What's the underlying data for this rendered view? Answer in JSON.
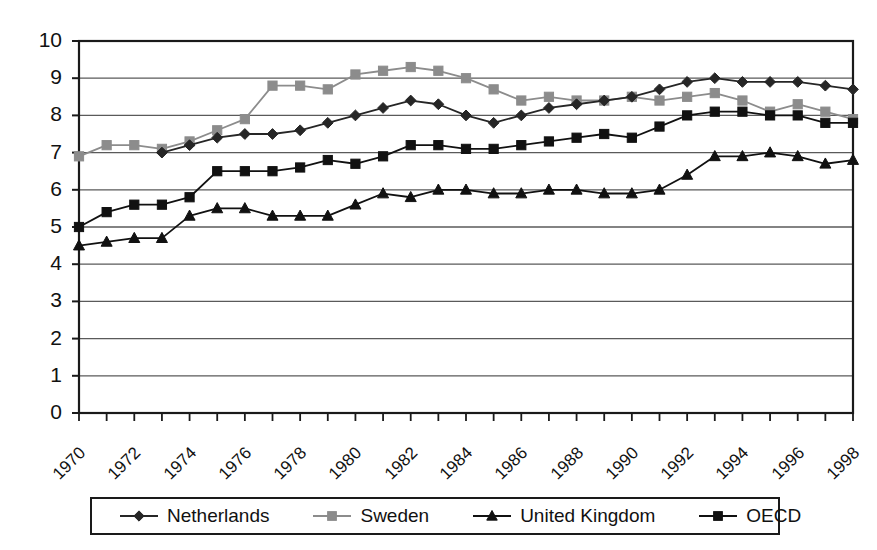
{
  "chart_data": {
    "type": "line",
    "title": "",
    "subtitle": "",
    "xlabel": "",
    "ylabel": "",
    "xlim": [
      1970,
      1998
    ],
    "ylim": [
      0,
      10
    ],
    "yticks": [
      "0",
      "1",
      "2",
      "3",
      "4",
      "5",
      "6",
      "7",
      "8",
      "9",
      "10"
    ],
    "grid": "horizontal",
    "legend_position": "bottom",
    "x": [
      1970,
      1971,
      1972,
      1973,
      1974,
      1975,
      1976,
      1977,
      1978,
      1979,
      1980,
      1981,
      1982,
      1983,
      1984,
      1985,
      1986,
      1987,
      1988,
      1989,
      1990,
      1991,
      1992,
      1993,
      1994,
      1995,
      1996,
      1997,
      1998
    ],
    "xtick_labels": [
      "1970",
      "1972",
      "1974",
      "1976",
      "1978",
      "1980",
      "1982",
      "1984",
      "1986",
      "1988",
      "1990",
      "1992",
      "1994",
      "1996",
      "1998"
    ],
    "xtick_values": [
      1970,
      1972,
      1974,
      1976,
      1978,
      1980,
      1982,
      1984,
      1986,
      1988,
      1990,
      1992,
      1994,
      1996,
      1998
    ],
    "series": [
      {
        "name": "Netherlands",
        "marker": "diamond",
        "color": "#262626",
        "values": [
          null,
          null,
          null,
          7.0,
          7.2,
          7.4,
          7.5,
          7.5,
          7.6,
          7.8,
          8.0,
          8.2,
          8.4,
          8.3,
          8.0,
          7.8,
          8.0,
          8.2,
          8.3,
          8.4,
          8.5,
          8.7,
          8.9,
          9.0,
          8.9,
          8.9,
          8.9,
          8.8,
          8.7
        ]
      },
      {
        "name": "Sweden",
        "marker": "square",
        "color": "#8c8c8c",
        "values": [
          6.9,
          7.2,
          7.2,
          7.1,
          7.3,
          7.6,
          7.9,
          8.8,
          8.8,
          8.7,
          9.1,
          9.2,
          9.3,
          9.2,
          9.0,
          8.7,
          8.4,
          8.5,
          8.4,
          8.4,
          8.5,
          8.4,
          8.5,
          8.6,
          8.4,
          8.1,
          8.3,
          8.1,
          7.9
        ]
      },
      {
        "name": "United Kingdom",
        "marker": "triangle",
        "color": "#111111",
        "values": [
          4.5,
          4.6,
          4.7,
          4.7,
          5.3,
          5.5,
          5.5,
          5.3,
          5.3,
          5.3,
          5.6,
          5.9,
          5.8,
          6.0,
          6.0,
          5.9,
          5.9,
          6.0,
          6.0,
          5.9,
          5.9,
          6.0,
          6.4,
          6.9,
          6.9,
          7.0,
          6.9,
          6.7,
          6.8
        ]
      },
      {
        "name": "OECD",
        "marker": "square",
        "color": "#111111",
        "values": [
          5.0,
          5.4,
          5.6,
          5.6,
          5.8,
          6.5,
          6.5,
          6.5,
          6.6,
          6.8,
          6.7,
          6.9,
          7.2,
          7.2,
          7.1,
          7.1,
          7.2,
          7.3,
          7.4,
          7.5,
          7.4,
          7.7,
          8.0,
          8.1,
          8.1,
          8.0,
          8.0,
          7.8,
          7.8
        ]
      }
    ]
  },
  "legend": {
    "items": [
      {
        "label": "Netherlands",
        "marker": "diamond-marker",
        "color": "#262626"
      },
      {
        "label": "Sweden",
        "marker": "square-marker",
        "color": "#8c8c8c"
      },
      {
        "label": "United Kingdom",
        "marker": "triangle-marker",
        "color": "#111111"
      },
      {
        "label": "OECD",
        "marker": "square-marker",
        "color": "#111111"
      }
    ]
  },
  "axes": {
    "frame_color": "#1a1a1a",
    "grid_color": "#5a5a5a"
  }
}
